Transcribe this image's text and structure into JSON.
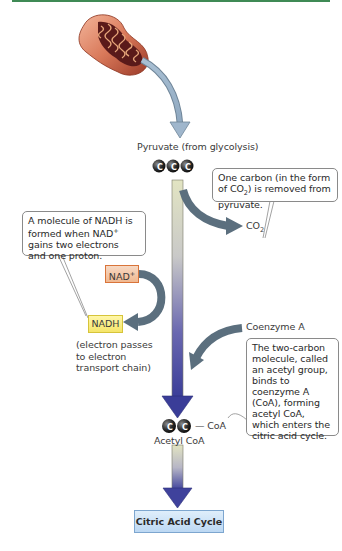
{
  "diagram": {
    "type": "pyruvate-oxidation-pathway",
    "accent_colors": {
      "top_rule": "#3f8a55",
      "main_arrow_top": "#d9dcb8",
      "main_arrow_bottom": "#3b3f9a",
      "side_arrows": "#5b6f7e",
      "nad_plus_box": "#f0b890",
      "nadh_box": "#f5e56a",
      "citric_acid_box": "#bcd8f3"
    },
    "labels": {
      "pyruvate": "Pyruvate (from glycolysis)",
      "co2_base": "CO",
      "co2_sub": "2",
      "nad_plus_base": "NAD",
      "nad_plus_sup": "+",
      "nadh": "NADH",
      "electron_note_line1": "(electron passes",
      "electron_note_line2": "to electron",
      "electron_note_line3": "transport chain)",
      "coenzyme_a": "Coenzyme A",
      "coa_tag": "— CoA",
      "acetyl_coa": "Acetyl CoA",
      "citric_acid_cycle": "Citric Acid Cycle",
      "carbon_symbol": "C"
    },
    "callouts": {
      "co2_removed": {
        "line1": "One carbon (in the form",
        "line2a": "of CO",
        "line2sub": "2",
        "line2b": ") is removed from",
        "line3": "pyruvate."
      },
      "nadh_formed": {
        "line1": "A molecule of NADH is",
        "line2a": "formed when NAD",
        "line2sup": "+",
        "line3": "gains two electrons",
        "line4": "and one proton."
      },
      "acetyl_group": {
        "line1": "The two-carbon",
        "line2": "molecule, called",
        "line3": "an acetyl group,",
        "line4": "binds to",
        "line5": "coenzyme A",
        "line6": "(CoA), forming",
        "line7": "acetyl CoA,",
        "line8": "which enters the",
        "line9": "citric acid cycle."
      }
    },
    "molecules": {
      "pyruvate_carbons": 3,
      "acetyl_carbons": 2
    }
  }
}
